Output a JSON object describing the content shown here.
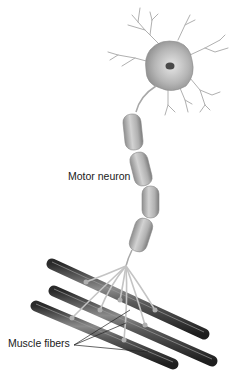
{
  "figure": {
    "labels": {
      "motor_neuron": "Motor neuron",
      "muscle_fibers": "Muscle fibers"
    },
    "colors": {
      "background": "#ffffff",
      "neuron_fill": "#a9a9a9",
      "myelin_fill": "#b8b8b8",
      "fiber_dark": "#3c3c3c",
      "axon_branch": "#c8c8c8",
      "label_text": "#1a1a1a"
    }
  }
}
